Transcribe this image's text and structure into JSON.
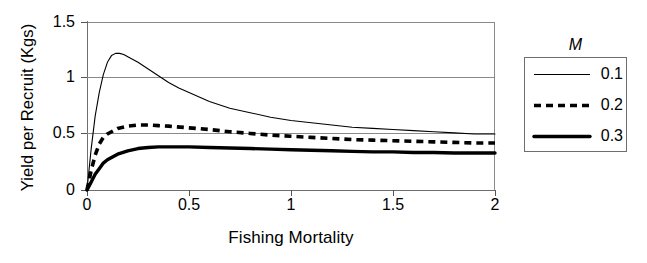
{
  "chart_data": {
    "type": "line",
    "title": "",
    "xlabel": "Fishing Mortality",
    "ylabel": "Yield per Recruit (Kgs)",
    "xlim": [
      0,
      2
    ],
    "ylim": [
      0,
      1.5
    ],
    "xticks": [
      "0",
      "0.5",
      "1",
      "1.5",
      "2"
    ],
    "xtick_values": [
      0,
      0.5,
      1,
      1.5,
      2
    ],
    "yticks": [
      "0",
      "0.5",
      "1",
      "1.5"
    ],
    "ytick_values": [
      0,
      0.5,
      1,
      1.5
    ],
    "grid": "horizontal",
    "legend_position": "right-outside",
    "legend_title": "M",
    "series": [
      {
        "name": "0.1",
        "style": "thin-solid",
        "x": [
          0,
          0.02,
          0.04,
          0.06,
          0.08,
          0.1,
          0.12,
          0.14,
          0.16,
          0.18,
          0.2,
          0.25,
          0.3,
          0.35,
          0.4,
          0.45,
          0.5,
          0.6,
          0.7,
          0.8,
          0.9,
          1.0,
          1.1,
          1.2,
          1.3,
          1.4,
          1.5,
          1.6,
          1.7,
          1.8,
          1.9,
          2.0
        ],
        "y": [
          0,
          0.36,
          0.66,
          0.87,
          1.03,
          1.14,
          1.2,
          1.22,
          1.22,
          1.21,
          1.19,
          1.14,
          1.08,
          1.02,
          0.96,
          0.91,
          0.87,
          0.79,
          0.73,
          0.69,
          0.65,
          0.62,
          0.6,
          0.58,
          0.56,
          0.55,
          0.54,
          0.53,
          0.52,
          0.51,
          0.5,
          0.5
        ]
      },
      {
        "name": "0.2",
        "style": "bold-dashed",
        "x": [
          0,
          0.02,
          0.04,
          0.06,
          0.08,
          0.1,
          0.15,
          0.2,
          0.25,
          0.3,
          0.35,
          0.4,
          0.5,
          0.6,
          0.7,
          0.8,
          0.9,
          1.0,
          1.1,
          1.2,
          1.3,
          1.4,
          1.5,
          1.6,
          1.7,
          1.8,
          1.9,
          2.0
        ],
        "y": [
          0,
          0.17,
          0.31,
          0.41,
          0.47,
          0.5,
          0.55,
          0.57,
          0.58,
          0.58,
          0.575,
          0.57,
          0.555,
          0.54,
          0.52,
          0.505,
          0.49,
          0.48,
          0.47,
          0.46,
          0.45,
          0.445,
          0.44,
          0.435,
          0.43,
          0.425,
          0.42,
          0.42
        ]
      },
      {
        "name": "0.3",
        "style": "thick-solid",
        "x": [
          0,
          0.02,
          0.04,
          0.06,
          0.08,
          0.1,
          0.15,
          0.2,
          0.25,
          0.3,
          0.35,
          0.4,
          0.5,
          0.6,
          0.7,
          0.8,
          0.9,
          1.0,
          1.1,
          1.2,
          1.3,
          1.4,
          1.5,
          1.6,
          1.7,
          1.8,
          1.9,
          2.0
        ],
        "y": [
          0,
          0.07,
          0.14,
          0.19,
          0.24,
          0.27,
          0.32,
          0.35,
          0.37,
          0.38,
          0.385,
          0.385,
          0.385,
          0.38,
          0.375,
          0.37,
          0.365,
          0.36,
          0.355,
          0.35,
          0.345,
          0.34,
          0.34,
          0.335,
          0.335,
          0.33,
          0.33,
          0.33
        ]
      }
    ]
  },
  "legend": {
    "title": "M",
    "entries": [
      {
        "label": "0.1",
        "swatch": "thin-solid-line"
      },
      {
        "label": "0.2",
        "swatch": "bold-dashed-line"
      },
      {
        "label": "0.3",
        "swatch": "thick-solid-line"
      }
    ]
  },
  "colors": {
    "line": "#000000",
    "grid": "#8a8a8a",
    "axis": "#6e6e6e",
    "background": "#ffffff"
  }
}
